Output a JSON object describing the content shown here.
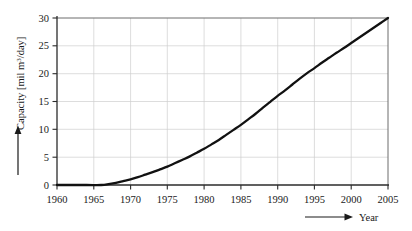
{
  "chart_data": {
    "type": "line",
    "title": "",
    "xlabel": "Year",
    "ylabel": "Capacity [mil m3/day]",
    "ylabel_parts": {
      "prefix": "Capacity [mil m",
      "superscript": "3",
      "suffix": "/day]"
    },
    "x": [
      1960,
      1965,
      1970,
      1975,
      1980,
      1985,
      1990,
      1995,
      2000,
      2005
    ],
    "values": [
      0,
      0,
      1.0,
      3.3,
      6.5,
      10.8,
      16.0,
      21.0,
      25.5,
      30.0
    ],
    "series": [
      {
        "name": "Capacity",
        "color": "#111111",
        "points": [
          [
            1960,
            0
          ],
          [
            1964,
            0
          ],
          [
            1966,
            0
          ],
          [
            1967,
            0.15
          ],
          [
            1968,
            0.4
          ],
          [
            1969,
            0.7
          ],
          [
            1970,
            1.0
          ],
          [
            1971,
            1.4
          ],
          [
            1972,
            1.85
          ],
          [
            1973,
            2.3
          ],
          [
            1974,
            2.8
          ],
          [
            1975,
            3.3
          ],
          [
            1976,
            3.9
          ],
          [
            1977,
            4.5
          ],
          [
            1978,
            5.1
          ],
          [
            1979,
            5.8
          ],
          [
            1980,
            6.5
          ],
          [
            1981,
            7.3
          ],
          [
            1982,
            8.1
          ],
          [
            1983,
            9.0
          ],
          [
            1984,
            9.9
          ],
          [
            1985,
            10.8
          ],
          [
            1986,
            11.8
          ],
          [
            1987,
            12.8
          ],
          [
            1988,
            13.9
          ],
          [
            1989,
            14.95
          ],
          [
            1990,
            16.0
          ],
          [
            1991,
            17.0
          ],
          [
            1992,
            18.05
          ],
          [
            1993,
            19.1
          ],
          [
            1994,
            20.1
          ],
          [
            1995,
            21.0
          ],
          [
            1996,
            21.95
          ],
          [
            1997,
            22.85
          ],
          [
            1998,
            23.75
          ],
          [
            1999,
            24.6
          ],
          [
            2000,
            25.5
          ],
          [
            2001,
            26.4
          ],
          [
            2002,
            27.3
          ],
          [
            2003,
            28.2
          ],
          [
            2004,
            29.1
          ],
          [
            2005,
            30.0
          ]
        ]
      }
    ],
    "xlim": [
      1960,
      2005
    ],
    "ylim": [
      0,
      30
    ],
    "xticks": [
      "1960",
      "1965",
      "1970",
      "1975",
      "1980",
      "1985",
      "1990",
      "1995",
      "2000",
      "2005"
    ],
    "yticks": [
      "0",
      "5",
      "10",
      "15",
      "20",
      "25",
      "30"
    ],
    "grid": true,
    "legend": "none",
    "colors": {
      "line": "#111111",
      "grid": "#cfcfcf",
      "axis": "#3a3a3a",
      "background": "#ffffff"
    },
    "annotations": {
      "y_axis_arrow": "up-arrow",
      "x_axis_arrow": "right-arrow"
    }
  }
}
